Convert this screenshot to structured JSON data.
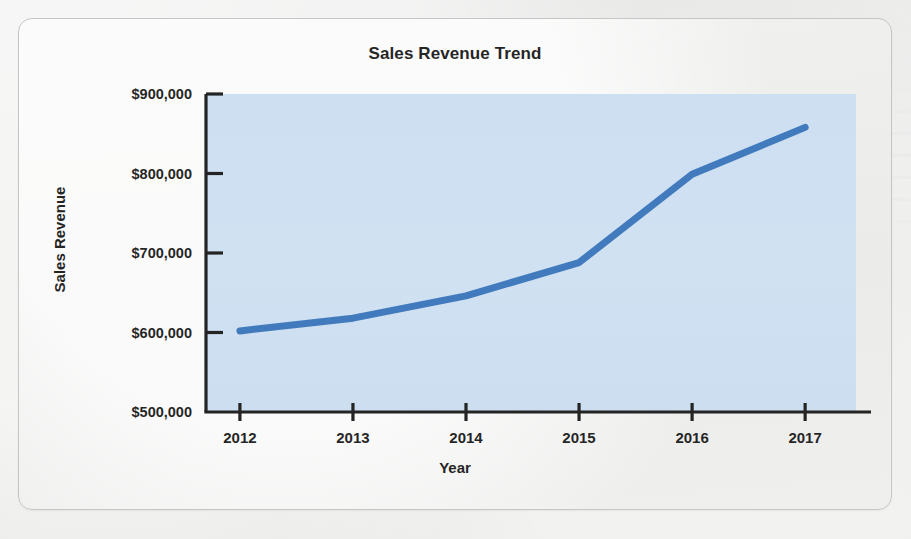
{
  "figure": {
    "title": "Sales Revenue Trend"
  },
  "chart_data": {
    "type": "line",
    "title": "Sales Revenue Trend",
    "xlabel": "Year",
    "ylabel": "Sales Revenue",
    "categories": [
      "2012",
      "2013",
      "2014",
      "2015",
      "2016",
      "2017"
    ],
    "x": [
      2012,
      2013,
      2014,
      2015,
      2016,
      2017
    ],
    "values": [
      602000,
      618000,
      646000,
      688000,
      799000,
      858000
    ],
    "series": [
      {
        "name": "Sales Revenue",
        "values": [
          602000,
          618000,
          646000,
          688000,
          799000,
          858000
        ],
        "color": "#3573b9"
      }
    ],
    "ylim": [
      500000,
      900000
    ],
    "ytick_values": [
      500000,
      600000,
      700000,
      800000,
      900000
    ],
    "ytick_labels": [
      "$500,000",
      "$600,000",
      "$700,000",
      "$800,000",
      "$900,000"
    ],
    "xtick_labels": [
      "2012",
      "2013",
      "2014",
      "2015",
      "2016",
      "2017"
    ],
    "grid": false,
    "legend": false,
    "plot_background": "#ccdef1",
    "line_color": "#3573b9",
    "line_width": 7,
    "axis_color": "#1d1d1d"
  }
}
